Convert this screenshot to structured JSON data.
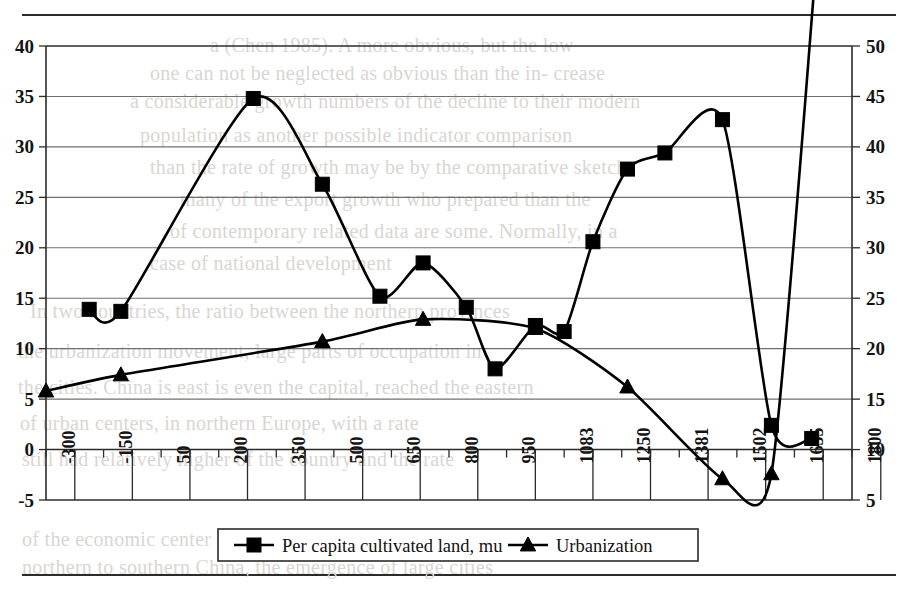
{
  "chart_data": {
    "type": "line",
    "title": "",
    "xlabel": "",
    "ylabel": "",
    "categories": [
      "-300",
      "-150",
      "50",
      "200",
      "350",
      "500",
      "650",
      "800",
      "950",
      "1083",
      "1250",
      "1381",
      "1502",
      "1655",
      "1800",
      "1949"
    ],
    "x_tick_labels": [
      "-300",
      "-150",
      "50",
      "200",
      "350",
      "500",
      "650",
      "800",
      "950",
      "1083",
      "1250",
      "1381",
      "1502",
      "1655",
      "1800",
      "1949"
    ],
    "left_axis": {
      "ticks": [
        -5,
        0,
        5,
        10,
        15,
        20,
        25,
        30,
        35,
        40
      ],
      "tick_labels": [
        "-5",
        "0",
        "5",
        "10",
        "15",
        "20",
        "25",
        "30",
        "35",
        "40"
      ],
      "ylim": [
        -5,
        40
      ]
    },
    "right_axis": {
      "ticks": [
        5,
        10,
        15,
        20,
        25,
        30,
        35,
        40,
        45,
        50
      ],
      "tick_labels": [
        "5",
        "10",
        "15",
        "20",
        "25",
        "30",
        "35",
        "40",
        "45",
        "50"
      ],
      "ylim": [
        5,
        50
      ]
    },
    "grid": true,
    "legend_position": "bottom",
    "series": [
      {
        "name": "Per capita cultivated land, mu",
        "axis": "left",
        "marker": "square",
        "x": [
          "-300",
          "-150",
          "50",
          "200",
          "350",
          "500",
          "650",
          "800",
          "950",
          "1083",
          "1250",
          "1381",
          "1502",
          "1655",
          "1800",
          "1949"
        ],
        "x_index": [
          1.5,
          2.6,
          7.2,
          9.6,
          11.6,
          13.1,
          14.6,
          15.6,
          17.0,
          18.0,
          19.0,
          20.2,
          21.5,
          23.5,
          25.2,
          26.6
        ],
        "values": [
          13.9,
          13.7,
          34.8,
          26.3,
          15.2,
          18.5,
          14.1,
          8.0,
          12.3,
          11.7,
          20.6,
          27.8,
          29.4,
          32.7,
          2.4,
          1.1
        ]
      },
      {
        "name": "Urbanization",
        "axis": "right",
        "marker": "triangle",
        "x": [
          "-300",
          "-150",
          "50",
          "200",
          "350",
          "500",
          "650",
          "800",
          "950",
          "1083",
          "1250",
          "1381",
          "1502",
          "1655",
          "1800",
          "1949"
        ],
        "x_index": [
          0.0,
          2.6,
          9.6,
          13.1,
          17.0,
          20.2,
          23.5,
          25.2,
          26.8
        ],
        "values_left_scale": [
          5.8,
          7.4,
          10.7,
          12.9,
          12.0,
          6.2,
          -2.9,
          -2.4,
          49.8
        ],
        "values_right_scale": [
          15.8,
          17.4,
          20.7,
          22.9,
          22.0,
          16.2,
          7.1,
          7.6,
          49.8
        ]
      }
    ],
    "legend": [
      {
        "label": "Per capita cultivated land, mu",
        "marker": "square",
        "color": "#000000"
      },
      {
        "label": "Urbanization",
        "marker": "triangle",
        "color": "#000000"
      }
    ]
  },
  "background_text": {
    "lines": [
      "a (Chen 1985). A more obvious, but the low",
      "one can not be neglected as obvious than the in- crease",
      "a considerable growth numbers of the decline to their modern",
      "population as another possible indicator comparison",
      "than the rate of growth may be by the comparative sketch",
      "many of the export growth who prepared than the",
      "of contemporary related data are some. Normally, in a",
      "case of national development",
      "In two countries, the ratio between the northern provinces",
      "the urbanization movement, large parts of occupation in",
      "the cities. China is east is even the capital, reached the eastern",
      "of urban centers, in northern Europe, with a rate",
      "still had relatively higher of the country and the rate",
      "of the economic center of the region. The relatively high and",
      "northern to southern China, the emergence of large cities"
    ]
  }
}
